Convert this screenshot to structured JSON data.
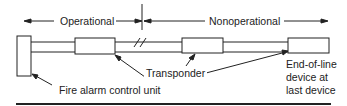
{
  "diagram": {
    "zones": {
      "operational": "Operational",
      "nonoperational": "Nonoperational"
    },
    "labels": {
      "control_unit": "Fire alarm control unit",
      "transponder": "Transponder",
      "eol_line1": "End-of-line",
      "eol_line2": "device at",
      "eol_line3": "last device"
    },
    "colors": {
      "stroke": "#222222",
      "background": "#ffffff"
    }
  }
}
